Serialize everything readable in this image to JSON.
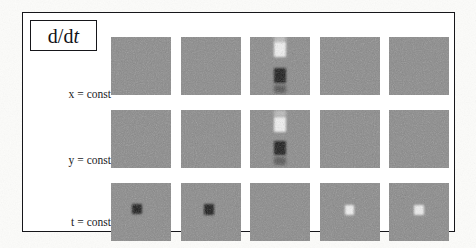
{
  "figure": {
    "operator_label": {
      "prefix": "d/d",
      "variable": "t"
    },
    "row_labels": [
      {
        "name": "row-label-x",
        "variable": "x",
        "relation": "=",
        "value": "const"
      },
      {
        "name": "row-label-y",
        "variable": "y",
        "relation": "=",
        "value": "const"
      },
      {
        "name": "row-label-t",
        "variable": "t",
        "relation": "=",
        "value": "const"
      }
    ],
    "colors": {
      "background": "#fcfcfa",
      "frame_line": "#16161a",
      "panel_noise_mid": "#8a8a8a",
      "blob_dark": "#161616",
      "blob_light": "#f2f2f2",
      "text": "#16161a"
    },
    "grid": {
      "columns": 5,
      "rows": 3,
      "panel_width": 60,
      "panel_height": 58,
      "column_gap": 9.5,
      "row_gap": 15
    }
  },
  "chart_data": {
    "type": "heatmap",
    "title": "d/dt",
    "xlabel": "",
    "ylabel": "",
    "rows": [
      "x = const",
      "y = const",
      "t = const"
    ],
    "columns": [
      "1",
      "2",
      "3",
      "4",
      "5"
    ],
    "noise_level": "high",
    "panels": [
      {
        "row": "x = const",
        "col": 1,
        "features": []
      },
      {
        "row": "x = const",
        "col": 2,
        "features": []
      },
      {
        "row": "x = const",
        "col": 3,
        "features": [
          {
            "kind": "bright-lobe",
            "cx_pct": 50,
            "cy_pct": 22,
            "w_pct": 20,
            "h_pct": 26,
            "value": 1.0
          },
          {
            "kind": "dark-lobe",
            "cx_pct": 50,
            "cy_pct": 66,
            "w_pct": 20,
            "h_pct": 26,
            "value": -1.0
          },
          {
            "kind": "bright-tail",
            "cx_pct": 50,
            "cy_pct": 4,
            "w_pct": 19,
            "h_pct": 12,
            "value": 0.45
          },
          {
            "kind": "dark-tail",
            "cx_pct": 50,
            "cy_pct": 90,
            "w_pct": 19,
            "h_pct": 14,
            "value": -0.4
          }
        ]
      },
      {
        "row": "x = const",
        "col": 4,
        "features": []
      },
      {
        "row": "x = const",
        "col": 5,
        "features": []
      },
      {
        "row": "y = const",
        "col": 1,
        "features": []
      },
      {
        "row": "y = const",
        "col": 2,
        "features": []
      },
      {
        "row": "y = const",
        "col": 3,
        "features": [
          {
            "kind": "bright-lobe",
            "cx_pct": 50,
            "cy_pct": 25,
            "w_pct": 20,
            "h_pct": 26,
            "value": 1.0
          },
          {
            "kind": "dark-lobe",
            "cx_pct": 50,
            "cy_pct": 66,
            "w_pct": 20,
            "h_pct": 24,
            "value": -1.0
          },
          {
            "kind": "bright-tail",
            "cx_pct": 50,
            "cy_pct": 6,
            "w_pct": 19,
            "h_pct": 12,
            "value": 0.4
          },
          {
            "kind": "dark-tail",
            "cx_pct": 50,
            "cy_pct": 88,
            "w_pct": 19,
            "h_pct": 14,
            "value": -0.35
          }
        ]
      },
      {
        "row": "y = const",
        "col": 4,
        "features": []
      },
      {
        "row": "y = const",
        "col": 5,
        "features": []
      },
      {
        "row": "t = const",
        "col": 1,
        "features": [
          {
            "kind": "dark-lobe",
            "cx_pct": 44,
            "cy_pct": 45,
            "w_pct": 17,
            "h_pct": 18,
            "value": -1.0
          }
        ]
      },
      {
        "row": "t = const",
        "col": 2,
        "features": [
          {
            "kind": "dark-lobe",
            "cx_pct": 47,
            "cy_pct": 46,
            "w_pct": 17,
            "h_pct": 18,
            "value": -1.0
          }
        ]
      },
      {
        "row": "t = const",
        "col": 3,
        "features": []
      },
      {
        "row": "t = const",
        "col": 4,
        "features": [
          {
            "kind": "bright-lobe",
            "cx_pct": 50,
            "cy_pct": 46,
            "w_pct": 16,
            "h_pct": 17,
            "value": 1.0
          }
        ]
      },
      {
        "row": "t = const",
        "col": 5,
        "features": [
          {
            "kind": "bright-lobe",
            "cx_pct": 50,
            "cy_pct": 46,
            "w_pct": 16,
            "h_pct": 17,
            "value": 0.9
          }
        ]
      }
    ]
  }
}
